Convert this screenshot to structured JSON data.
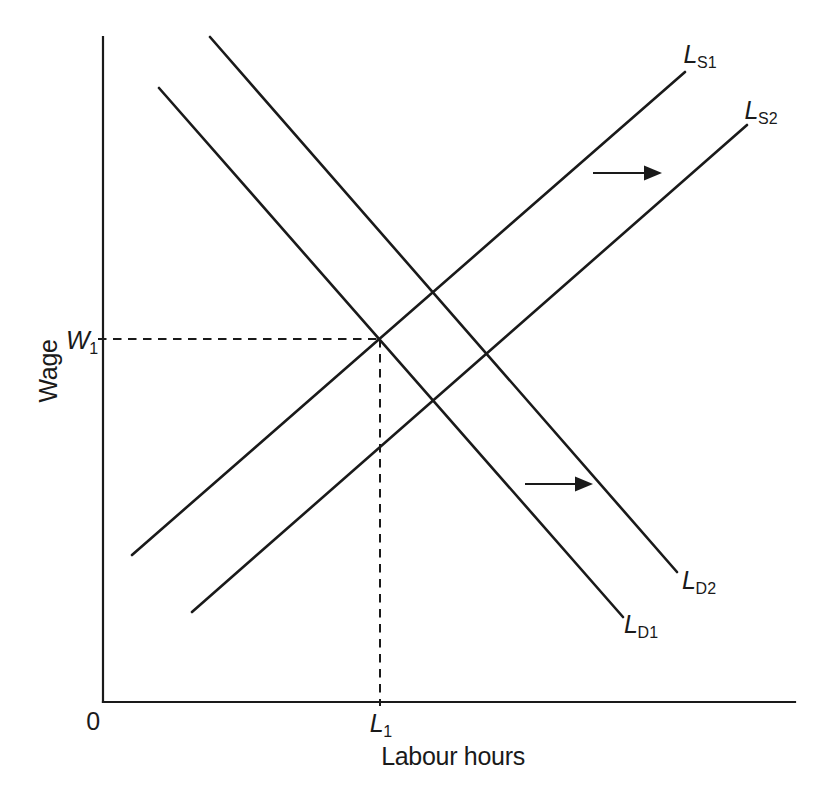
{
  "page": {
    "background": "#ffffff",
    "ink": "#1a1a1a"
  },
  "chart_data": {
    "type": "line",
    "title": "",
    "xlabel": "Labour hours",
    "ylabel": "Wage",
    "origin_label": "0",
    "x_tick": {
      "main": "L",
      "sub": "1"
    },
    "y_tick": {
      "main": "W",
      "sub": "1"
    },
    "grid": "off",
    "legend": "none",
    "axes": {
      "y": {
        "x": 103,
        "top": 37,
        "bottom": 702
      },
      "x": {
        "y": 702,
        "left": 103,
        "right": 795
      }
    },
    "curves": [
      {
        "id": "labour-supply-1",
        "kind": "supply",
        "slope": "upward",
        "label": {
          "main": "L",
          "sub": "S1"
        },
        "from": [
          132,
          555
        ],
        "to": [
          685,
          72
        ]
      },
      {
        "id": "labour-supply-2",
        "kind": "supply",
        "slope": "upward",
        "label": {
          "main": "L",
          "sub": "S2"
        },
        "from": [
          192,
          612
        ],
        "to": [
          747,
          125
        ]
      },
      {
        "id": "labour-demand-1",
        "kind": "demand",
        "slope": "downward",
        "label": {
          "main": "L",
          "sub": "D1"
        },
        "from": [
          159,
          88
        ],
        "to": [
          623,
          617
        ]
      },
      {
        "id": "labour-demand-2",
        "kind": "demand",
        "slope": "downward",
        "label": {
          "main": "L",
          "sub": "D2"
        },
        "from": [
          210,
          37
        ],
        "to": [
          677,
          572
        ]
      }
    ],
    "equilibrium": {
      "at": "LS1 x LD1",
      "wage_label": "W1",
      "labour_label": "L1",
      "x": 380,
      "y": 339
    },
    "guides": [
      {
        "id": "wage-equilibrium-guide",
        "style": "dashed",
        "from": [
          98,
          339
        ],
        "to": [
          380,
          339
        ]
      },
      {
        "id": "labour-equilibrium-guide",
        "style": "dashed",
        "from": [
          380,
          339
        ],
        "to": [
          380,
          706
        ]
      }
    ],
    "shift_arrows": [
      {
        "id": "supply-shift-arrow",
        "direction": "right",
        "from": [
          593,
          173
        ],
        "to": [
          662,
          173
        ]
      },
      {
        "id": "demand-shift-arrow",
        "direction": "right",
        "from": [
          525,
          484
        ],
        "to": [
          593,
          484
        ]
      }
    ]
  }
}
